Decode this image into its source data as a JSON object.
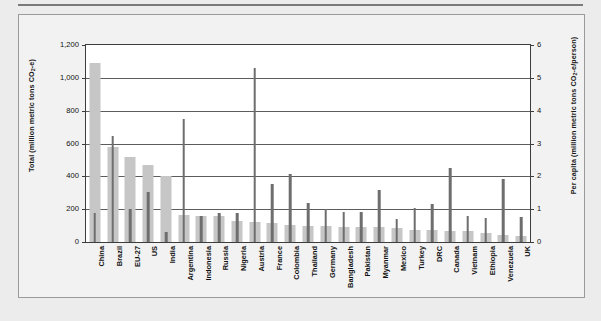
{
  "figure": {
    "background_color": "#f2f2f2",
    "plot_background_color": "#ffffff",
    "total_bar_color": "#c6c6c6",
    "per_capita_bar_color": "#6e6e6e",
    "gridline_color": "#5c5c5c",
    "axis_color": "#3d3d3d"
  },
  "axes": {
    "left_title_pre": "Total (million metric tons CO",
    "left_title_sub": "2",
    "left_title_post": "-e)",
    "right_title_pre": "Per capita  (million metric tons CO",
    "right_title_sub": "2",
    "right_title_post": "-e/person)",
    "left_ticks": [
      "0",
      "200",
      "400",
      "600",
      "800",
      "1,000",
      "1,200"
    ],
    "right_ticks": [
      "0",
      "1",
      "2",
      "3",
      "4",
      "5",
      "6"
    ]
  },
  "chart_data": {
    "type": "bar",
    "title": "",
    "xlabel": "",
    "ylabel": "Total (million metric tons CO2-e)",
    "y2label": "Per capita (million metric tons CO2-e/person)",
    "ylim": [
      0,
      1200
    ],
    "y2lim": [
      0,
      6
    ],
    "yticks": [
      0,
      200,
      400,
      600,
      800,
      1000,
      1200
    ],
    "y2ticks": [
      0,
      1,
      2,
      3,
      4,
      5,
      6
    ],
    "grid": true,
    "legend": "none",
    "categories": [
      "China",
      "Brazil",
      "EU-27",
      "US",
      "India",
      "Argentina",
      "Indonesia",
      "Russia",
      "Nigeria",
      "Austria",
      "France",
      "Colombia",
      "Thailand",
      "Germany",
      "Bangladesh",
      "Pakistan",
      "Myanmar",
      "Mexico",
      "Turkey",
      "DRC",
      "Canada",
      "Vietnam",
      "Ethiopia",
      "Venezuela",
      "UK"
    ],
    "series": [
      {
        "name": "Total",
        "axis": "left",
        "unit": "million metric tons CO2-e",
        "values": [
          1090,
          580,
          515,
          470,
          400,
          165,
          160,
          160,
          130,
          120,
          115,
          105,
          100,
          100,
          90,
          90,
          90,
          85,
          75,
          75,
          65,
          65,
          55,
          40,
          35
        ]
      },
      {
        "name": "Per capita",
        "axis": "right",
        "unit": "million metric tons CO2-e/person",
        "values": [
          0.88,
          3.22,
          1.0,
          1.52,
          0.32,
          3.75,
          0.8,
          0.88,
          0.87,
          5.3,
          1.78,
          2.08,
          1.18,
          1.0,
          0.9,
          0.9,
          1.58,
          0.7,
          1.05,
          1.15,
          2.25,
          0.78,
          0.72,
          1.92,
          0.75
        ]
      }
    ]
  }
}
